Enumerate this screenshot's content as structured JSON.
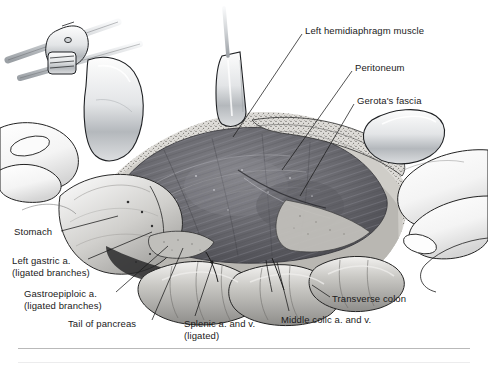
{
  "figure": {
    "view": "Operative field, anterior view, left subcostal incision held open by retractor blades and the surgeon's hands",
    "style": "monochrome pen-and-ink / stipple medical illustration, grayscale"
  },
  "labels": [
    {
      "id": "left-hemidiaphragm-muscle",
      "line1": "Left hemidiaphragm muscle",
      "line2": "",
      "x": 305,
      "y": 25,
      "align": "left",
      "leader": {
        "x1": 302,
        "y1": 34,
        "x2": 233,
        "y2": 137
      }
    },
    {
      "id": "peritoneum",
      "line1": "Peritoneum",
      "line2": "",
      "x": 355,
      "y": 62,
      "align": "left",
      "leader": {
        "x1": 352,
        "y1": 71,
        "x2": 282,
        "y2": 170
      }
    },
    {
      "id": "gerotas-fascia",
      "line1": "Gerota's fascia",
      "line2": "",
      "x": 357,
      "y": 95,
      "align": "left",
      "leader": {
        "x1": 354,
        "y1": 104,
        "x2": 300,
        "y2": 196
      }
    },
    {
      "id": "stomach",
      "line1": "Stomach",
      "line2": "",
      "x": 14,
      "y": 226,
      "align": "left",
      "leader": {
        "x1": 61,
        "y1": 231,
        "x2": 118,
        "y2": 216
      }
    },
    {
      "id": "left-gastric-artery",
      "line1": "Left gastric a.",
      "line2": "(ligated branches)",
      "x": 12,
      "y": 255,
      "align": "left",
      "leader": {
        "x1": 88,
        "y1": 259,
        "x2": 152,
        "y2": 232
      }
    },
    {
      "id": "gastroepiploic-artery",
      "line1": "Gastroepiploic a.",
      "line2": "(ligated branches)",
      "x": 24,
      "y": 288,
      "align": "left",
      "leader": {
        "x1": 116,
        "y1": 292,
        "x2": 168,
        "y2": 246
      }
    },
    {
      "id": "tail-of-pancreas",
      "line1": "Tail of pancreas",
      "line2": "",
      "x": 68,
      "y": 318,
      "align": "left",
      "leader": {
        "x1": 152,
        "y1": 320,
        "x2": 183,
        "y2": 248
      }
    },
    {
      "id": "splenic-artery-and-vein",
      "line1": "Splenic a. and v.",
      "line2": "(ligated)",
      "x": 184,
      "y": 318,
      "align": "left",
      "leader": {
        "x1": 195,
        "y1": 316,
        "x2": 213,
        "y2": 262
      }
    },
    {
      "id": "middle-colic-artery-and-vein",
      "line1": "Middle colic a. and v.",
      "line2": "",
      "x": 281,
      "y": 314,
      "align": "left",
      "leader": {
        "x1": 289,
        "y1": 311,
        "x2": 277,
        "y2": 262
      }
    },
    {
      "id": "transverse-colon",
      "line1": "Transverse colon",
      "line2": "",
      "x": 332,
      "y": 293,
      "align": "left",
      "leader": {
        "x1": 330,
        "y1": 297,
        "x2": 312,
        "y2": 285
      }
    }
  ],
  "structures": [
    {
      "id": "retractor-frame-bar",
      "kind": "instrument"
    },
    {
      "id": "retractor-clamp",
      "kind": "instrument"
    },
    {
      "id": "retractor-blade-upper-left",
      "kind": "instrument"
    },
    {
      "id": "retractor-blade-center",
      "kind": "instrument"
    },
    {
      "id": "retractor-blade-right",
      "kind": "instrument"
    },
    {
      "id": "surgeon-hand-left",
      "kind": "anatomy"
    },
    {
      "id": "surgeon-hand-right",
      "kind": "anatomy"
    },
    {
      "id": "diaphragm-muscle-bed",
      "kind": "anatomy"
    },
    {
      "id": "peritoneal-fat-rim",
      "kind": "anatomy"
    },
    {
      "id": "stomach-body",
      "kind": "anatomy"
    },
    {
      "id": "transverse-colon-loops",
      "kind": "anatomy"
    },
    {
      "id": "pancreas-tail",
      "kind": "anatomy"
    }
  ],
  "palette": {
    "ink": "#1a1a1a",
    "divider": "#b9b9b9",
    "footer_rule": "#ececed",
    "muscle_dark": "#5d5d60",
    "muscle_mid": "#7b7b7e",
    "fat_light": "#d8d6d2",
    "metal_light": "#eceef0",
    "metal_shadow": "#a8acb0",
    "skin_light": "#fbfbfb",
    "bowel_mid": "#b8b8b6",
    "background": "#ffffff"
  }
}
